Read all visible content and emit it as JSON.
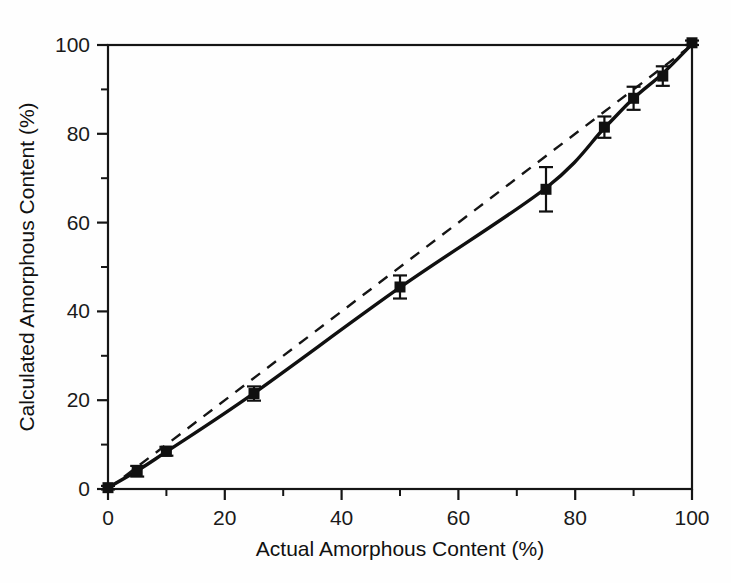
{
  "figure": {
    "background_color": "#fefefe",
    "ink_color": "#151515"
  },
  "chart_data": {
    "type": "scatter",
    "title": "",
    "subtitle": "",
    "xlabel": "Actual Amorphous Content (%)",
    "ylabel": "Calculated Amorphous Content (%)",
    "xlim": [
      0,
      100
    ],
    "ylim": [
      0,
      100
    ],
    "grid": false,
    "legend": null,
    "xticks": [
      0,
      20,
      40,
      60,
      80,
      100
    ],
    "xtick_labels": [
      "0",
      "20",
      "40",
      "60",
      "80",
      "100"
    ],
    "x_minor_ticks": [
      10,
      30,
      50,
      70,
      90
    ],
    "yticks": [
      0,
      20,
      40,
      60,
      80,
      100
    ],
    "ytick_labels": [
      "0",
      "20",
      "40",
      "60",
      "80",
      "100"
    ],
    "y_minor_ticks": [
      10,
      30,
      50,
      70,
      90
    ],
    "x": [
      0,
      5,
      10,
      25,
      50,
      75,
      85,
      90,
      95,
      100
    ],
    "y": [
      0.3,
      4.0,
      8.5,
      21.5,
      45.5,
      67.5,
      81.5,
      88.0,
      93.0,
      100.5
    ],
    "yerr_lower": [
      0.4,
      1.2,
      1.0,
      1.6,
      2.6,
      5.0,
      2.4,
      2.6,
      2.2,
      0.5
    ],
    "yerr_upper": [
      0.4,
      1.2,
      1.0,
      1.6,
      2.6,
      5.0,
      2.4,
      2.6,
      2.2,
      0.5
    ],
    "series": [
      {
        "name": "measured-data",
        "style": "filled-square-markers-with-error-bars",
        "marker": "square",
        "marker_color": "#101010",
        "values": [
          0.3,
          4.0,
          8.5,
          21.5,
          45.5,
          67.5,
          81.5,
          88.0,
          93.0,
          100.5
        ]
      },
      {
        "name": "fitted-curve",
        "style": "solid",
        "line_color": "#101010",
        "x": [
          0,
          5,
          10,
          25,
          50,
          75,
          85,
          90,
          95,
          100
        ],
        "values": [
          0.3,
          4.1,
          8.4,
          21.6,
          45.4,
          67.8,
          81.3,
          88.0,
          93.6,
          100.2
        ]
      },
      {
        "name": "one-to-one-reference",
        "style": "dashed",
        "line_color": "#151515",
        "x": [
          0,
          100
        ],
        "values": [
          0,
          100
        ]
      }
    ],
    "annotations": []
  },
  "axes": {
    "x_axis_name": "actual-amorphous-content-axis",
    "y_axis_name": "calculated-amorphous-content-axis",
    "tick_direction": "out",
    "frame": "box"
  }
}
